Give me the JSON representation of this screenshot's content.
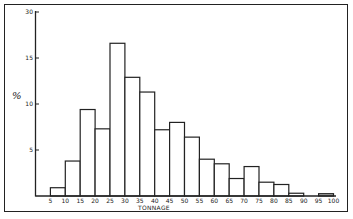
{
  "chart_data": {
    "type": "bar",
    "title": "",
    "xlabel": "TONNAGE",
    "ylabel": "%",
    "bin_edges": [
      5,
      10,
      15,
      20,
      25,
      30,
      35,
      40,
      45,
      50,
      55,
      60,
      65,
      70,
      75,
      80,
      85,
      90,
      95,
      100
    ],
    "categories": [
      "5-10",
      "10-15",
      "15-20",
      "20-25",
      "25-30",
      "30-35",
      "35-40",
      "40-45",
      "45-50",
      "50-55",
      "55-60",
      "60-65",
      "65-70",
      "70-75",
      "75-80",
      "80-85",
      "85-90",
      "90-95",
      "95-100"
    ],
    "values": [
      0.9,
      3.8,
      9.4,
      7.3,
      16.6,
      12.9,
      11.3,
      7.2,
      8.0,
      6.4,
      4.0,
      3.5,
      1.9,
      3.2,
      1.5,
      1.25,
      0.3,
      0,
      0.25
    ],
    "x_tick_labels": [
      "5",
      "10",
      "15",
      "20",
      "25",
      "30",
      "35",
      "40",
      "45",
      "50",
      "55",
      "60",
      "65",
      "70",
      "75",
      "80",
      "85",
      "90",
      "95",
      "100"
    ],
    "y_ticks": [
      5,
      10,
      15,
      20
    ],
    "y_tick_labels": [
      "5",
      "10",
      "15",
      "30"
    ],
    "ylim": [
      0,
      20
    ],
    "xlim": [
      0,
      100
    ],
    "grid": false,
    "legend": null
  },
  "colors": {
    "ink": "#222222",
    "bar_fill": "#ffffff",
    "last_bar_fill": "#bdbdbd"
  }
}
